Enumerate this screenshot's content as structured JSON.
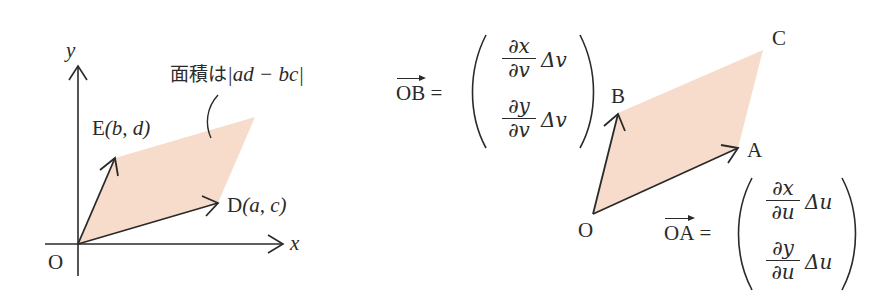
{
  "colors": {
    "fill": "#f8dccb",
    "stroke": "#2a2a2a",
    "background": "#ffffff"
  },
  "left_figure": {
    "axis_x_label": "x",
    "axis_y_label": "y",
    "origin_label": "O",
    "point_d": {
      "name": "D",
      "coords": "(a,  c)"
    },
    "point_e": {
      "name": "E",
      "coords": "(b,  d)"
    },
    "area_label_jp": "面積は",
    "area_label_expr": "|ad − bc|"
  },
  "right_figure": {
    "origin_label": "O",
    "point_a": "A",
    "point_b": "B",
    "point_c": "C",
    "ob_vector": {
      "lhs": "OB",
      "equals": "=",
      "row1": {
        "num": "∂x",
        "den": "∂v",
        "delta": "Δv"
      },
      "row2": {
        "num": "∂y",
        "den": "∂v",
        "delta": "Δv"
      }
    },
    "oa_vector": {
      "lhs": "OA",
      "equals": "=",
      "row1": {
        "num": "∂x",
        "den": "∂u",
        "delta": "Δu"
      },
      "row2": {
        "num": "∂y",
        "den": "∂u",
        "delta": "Δu"
      }
    }
  }
}
